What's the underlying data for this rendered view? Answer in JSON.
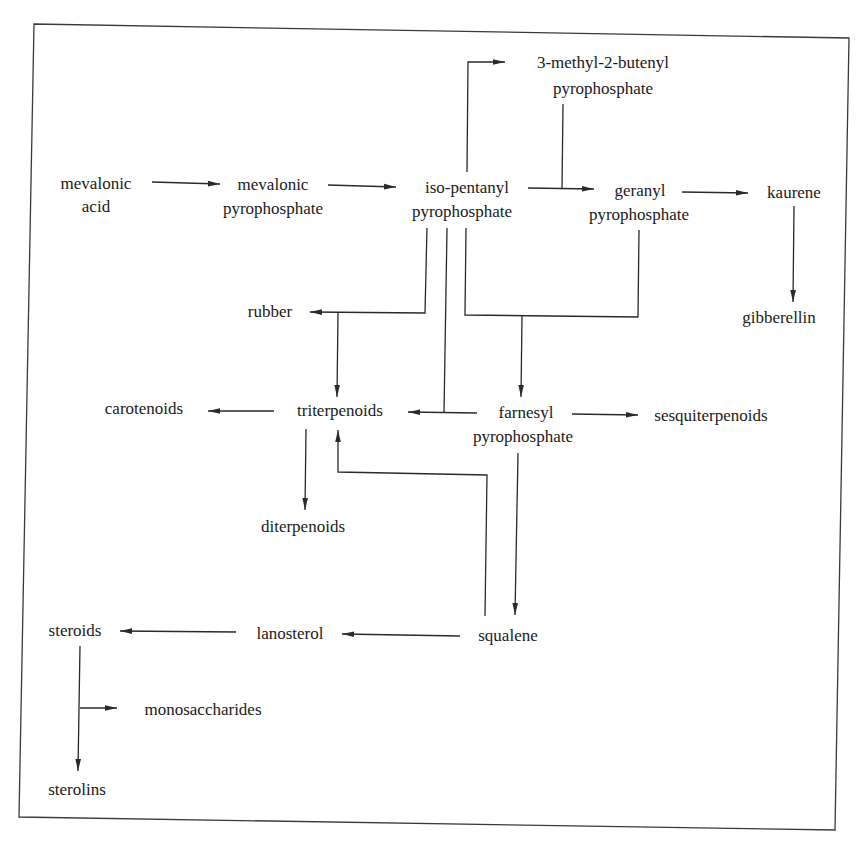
{
  "diagram": {
    "type": "metabolic pathway flowchart",
    "border_color": "#3a3a3a",
    "line_color": "#2a2a2a",
    "text_color": "#1a1a1a",
    "nodes": {
      "mevalonic_acid": {
        "line1": "mevalonic",
        "line2": "acid"
      },
      "mevalonic_pyrophosphate": {
        "line1": "mevalonic",
        "line2": "pyrophosphate"
      },
      "isopentanyl_pyrophosphate": {
        "line1": "iso-pentanyl",
        "line2": "pyrophosphate"
      },
      "methylbutenyl_pyrophosphate": {
        "line1": "3-methyl-2-butenyl",
        "line2": "pyrophosphate"
      },
      "geranyl_pyrophosphate": {
        "line1": "geranyl",
        "line2": "pyrophosphate"
      },
      "kaurene": {
        "line1": "kaurene"
      },
      "gibberellin": {
        "line1": "gibberellin"
      },
      "rubber": {
        "line1": "rubber"
      },
      "carotenoids": {
        "line1": "carotenoids"
      },
      "triterpenoids": {
        "line1": "triterpenoids"
      },
      "farnesyl_pyrophosphate": {
        "line1": "farnesyl",
        "line2": "pyrophosphate"
      },
      "sesquiterpenoids": {
        "line1": "sesquiterpenoids"
      },
      "diterpenoids": {
        "line1": "diterpenoids"
      },
      "steroids": {
        "line1": "steroids"
      },
      "lanosterol": {
        "line1": "lanosterol"
      },
      "squalene": {
        "line1": "squalene"
      },
      "monosaccharides": {
        "line1": "monosaccharides"
      },
      "sterolins": {
        "line1": "sterolins"
      }
    },
    "edges": [
      {
        "from": "mevalonic acid",
        "to": "mevalonic pyrophosphate"
      },
      {
        "from": "mevalonic pyrophosphate",
        "to": "iso-pentanyl pyrophosphate"
      },
      {
        "from": "iso-pentanyl pyrophosphate",
        "to": "3-methyl-2-butenyl pyrophosphate"
      },
      {
        "from": "iso-pentanyl pyrophosphate",
        "to": "geranyl pyrophosphate"
      },
      {
        "from": "3-methyl-2-butenyl pyrophosphate",
        "to": "geranyl pyrophosphate"
      },
      {
        "from": "geranyl pyrophosphate",
        "to": "kaurene"
      },
      {
        "from": "kaurene",
        "to": "gibberellin"
      },
      {
        "from": "iso-pentanyl pyrophosphate",
        "to": "rubber"
      },
      {
        "from": "iso-pentanyl pyrophosphate",
        "to": "triterpenoids"
      },
      {
        "from": "iso-pentanyl pyrophosphate",
        "to": "farnesyl pyrophosphate"
      },
      {
        "from": "geranyl pyrophosphate",
        "to": "farnesyl pyrophosphate"
      },
      {
        "from": "farnesyl pyrophosphate",
        "to": "triterpenoids"
      },
      {
        "from": "farnesyl pyrophosphate",
        "to": "sesquiterpenoids"
      },
      {
        "from": "triterpenoids",
        "to": "carotenoids"
      },
      {
        "from": "triterpenoids",
        "to": "diterpenoids"
      },
      {
        "from": "farnesyl pyrophosphate",
        "to": "squalene"
      },
      {
        "from": "squalene",
        "to": "triterpenoids"
      },
      {
        "from": "squalene",
        "to": "lanosterol"
      },
      {
        "from": "lanosterol",
        "to": "steroids"
      },
      {
        "from": "steroids",
        "to": "sterolins"
      },
      {
        "from": "steroids",
        "to": "monosaccharides"
      }
    ]
  }
}
